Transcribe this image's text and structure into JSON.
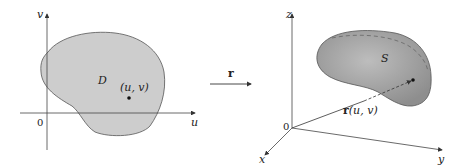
{
  "left_panel": {
    "axis_v_label": "v",
    "axis_u_label": "u",
    "origin_label": "0",
    "region_label": "D",
    "point_label": "(u, v)"
  },
  "mapping": {
    "arrow_label": "r"
  },
  "right_panel": {
    "axis_z_label": "z",
    "axis_x_label": "x",
    "axis_y_label": "y",
    "origin_label": "0",
    "surface_label": "S",
    "vector_label_bold": "r",
    "vector_label_args": "(u, v)"
  },
  "colors": {
    "region_fill": "#c9c9c9",
    "surface_fill": "#a9a9a9",
    "stroke": "#555555"
  }
}
